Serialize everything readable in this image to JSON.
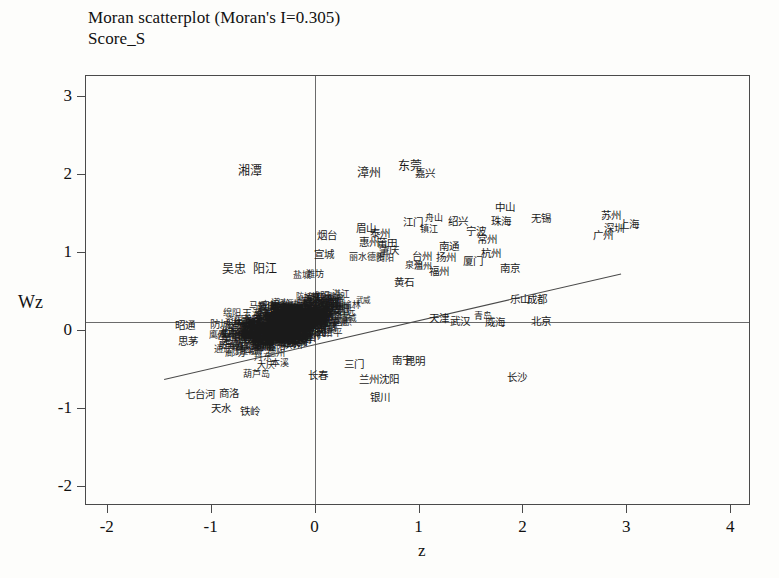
{
  "chart_data": {
    "type": "scatter",
    "title": "Moran scatterplot (Moran's I=0.305)",
    "subtitle": "Score_S",
    "xlabel": "z",
    "ylabel": "Wz",
    "morans_i": 0.305,
    "xlim": [
      -2.2,
      4.2
    ],
    "ylim": [
      -2.25,
      3.25
    ],
    "xticks": [
      "-2",
      "-1",
      "0",
      "1",
      "2",
      "3",
      "4"
    ],
    "xtick_values": [
      -2,
      -1,
      0,
      1,
      2,
      3,
      4
    ],
    "yticks": [
      "3",
      "2",
      "1",
      "0",
      "-1",
      "-2"
    ],
    "ytick_values": [
      3,
      2,
      1,
      0,
      -1,
      -2
    ],
    "grid": false,
    "legend": null,
    "reference_lines": {
      "horizontal_at_y": 0.1,
      "vertical_at_x": 0.0
    },
    "fit_line": {
      "x_start": -1.45,
      "y_start": -0.62,
      "x_end": 2.95,
      "y_end": 0.73,
      "slope": 0.305
    },
    "points": [
      {
        "label": "湘潭",
        "x": -0.62,
        "y": 2.03,
        "size": "l"
      },
      {
        "label": "漳州",
        "x": 0.52,
        "y": 2.01,
        "size": "l"
      },
      {
        "label": "东莞",
        "x": 0.92,
        "y": 2.1,
        "size": "l"
      },
      {
        "label": "嘉兴",
        "x": 1.06,
        "y": 2.01,
        "size": "m"
      },
      {
        "label": "中山",
        "x": 1.83,
        "y": 1.58,
        "size": "m"
      },
      {
        "label": "苏州",
        "x": 2.85,
        "y": 1.47,
        "size": "m"
      },
      {
        "label": "上海",
        "x": 3.03,
        "y": 1.36,
        "size": "m"
      },
      {
        "label": "深圳",
        "x": 2.88,
        "y": 1.31,
        "size": "m"
      },
      {
        "label": "广州",
        "x": 2.78,
        "y": 1.22,
        "size": "m"
      },
      {
        "label": "无锡",
        "x": 2.18,
        "y": 1.43,
        "size": "m"
      },
      {
        "label": "珠海",
        "x": 1.79,
        "y": 1.4,
        "size": "m"
      },
      {
        "label": "绍兴",
        "x": 1.38,
        "y": 1.39,
        "size": "m"
      },
      {
        "label": "江门",
        "x": 0.95,
        "y": 1.38,
        "size": "m"
      },
      {
        "label": "舟山",
        "x": 1.15,
        "y": 1.43,
        "size": "s"
      },
      {
        "label": "镇江",
        "x": 1.1,
        "y": 1.29,
        "size": "s"
      },
      {
        "label": "宁波",
        "x": 1.55,
        "y": 1.27,
        "size": "m"
      },
      {
        "label": "常州",
        "x": 1.66,
        "y": 1.17,
        "size": "m"
      },
      {
        "label": "眉山",
        "x": 0.49,
        "y": 1.3,
        "size": "m"
      },
      {
        "label": "泰州",
        "x": 0.63,
        "y": 1.24,
        "size": "m"
      },
      {
        "label": "烟台",
        "x": 0.12,
        "y": 1.22,
        "size": "m"
      },
      {
        "label": "惠州",
        "x": 0.52,
        "y": 1.13,
        "size": "m"
      },
      {
        "label": "莆田",
        "x": 0.7,
        "y": 1.12,
        "size": "m"
      },
      {
        "label": "肇庆",
        "x": 0.72,
        "y": 1.03,
        "size": "m"
      },
      {
        "label": "南通",
        "x": 1.29,
        "y": 1.07,
        "size": "m"
      },
      {
        "label": "杭州",
        "x": 1.7,
        "y": 0.99,
        "size": "m"
      },
      {
        "label": "宣城",
        "x": 0.09,
        "y": 0.97,
        "size": "m"
      },
      {
        "label": "丽水",
        "x": 0.42,
        "y": 0.93,
        "size": "s"
      },
      {
        "label": "德阳",
        "x": 0.59,
        "y": 0.94,
        "size": "s"
      },
      {
        "label": "贵阳",
        "x": 0.68,
        "y": 0.92,
        "size": "s"
      },
      {
        "label": "台州",
        "x": 1.03,
        "y": 0.95,
        "size": "m"
      },
      {
        "label": "扬州",
        "x": 1.26,
        "y": 0.94,
        "size": "m"
      },
      {
        "label": "厦门",
        "x": 1.52,
        "y": 0.88,
        "size": "m"
      },
      {
        "label": "泉州",
        "x": 0.96,
        "y": 0.83,
        "size": "s"
      },
      {
        "label": "温州",
        "x": 1.04,
        "y": 0.82,
        "size": "s"
      },
      {
        "label": "福州",
        "x": 1.2,
        "y": 0.76,
        "size": "m"
      },
      {
        "label": "南京",
        "x": 1.88,
        "y": 0.8,
        "size": "m"
      },
      {
        "label": "吴忠",
        "x": -0.78,
        "y": 0.78,
        "size": "l"
      },
      {
        "label": "阳江",
        "x": -0.48,
        "y": 0.78,
        "size": "l"
      },
      {
        "label": "盐城",
        "x": -0.12,
        "y": 0.7,
        "size": "s"
      },
      {
        "label": "潍坊",
        "x": 0.0,
        "y": 0.72,
        "size": "s"
      },
      {
        "label": "黄石",
        "x": 0.86,
        "y": 0.62,
        "size": "m"
      },
      {
        "label": "乐山",
        "x": 1.98,
        "y": 0.4,
        "size": "m"
      },
      {
        "label": "成都",
        "x": 2.14,
        "y": 0.4,
        "size": "m"
      },
      {
        "label": "天津",
        "x": 1.2,
        "y": 0.16,
        "size": "m"
      },
      {
        "label": "武汉",
        "x": 1.4,
        "y": 0.12,
        "size": "m"
      },
      {
        "label": "青岛",
        "x": 1.62,
        "y": 0.18,
        "size": "s"
      },
      {
        "label": "威海",
        "x": 1.74,
        "y": 0.1,
        "size": "m"
      },
      {
        "label": "北京",
        "x": 2.18,
        "y": 0.11,
        "size": "m"
      },
      {
        "label": "昭通",
        "x": -1.25,
        "y": 0.07,
        "size": "m"
      },
      {
        "label": "思茅",
        "x": -1.22,
        "y": -0.14,
        "size": "m"
      },
      {
        "label": "三门",
        "x": 0.38,
        "y": -0.43,
        "size": "m"
      },
      {
        "label": "南宁",
        "x": 0.84,
        "y": -0.38,
        "size": "m"
      },
      {
        "label": "昆明",
        "x": 0.97,
        "y": -0.4,
        "size": "m"
      },
      {
        "label": "兰州",
        "x": 0.52,
        "y": -0.62,
        "size": "m"
      },
      {
        "label": "沈阳",
        "x": 0.72,
        "y": -0.62,
        "size": "m"
      },
      {
        "label": "银川",
        "x": 0.63,
        "y": -0.86,
        "size": "m"
      },
      {
        "label": "长沙",
        "x": 1.95,
        "y": -0.6,
        "size": "m"
      },
      {
        "label": "长春",
        "x": 0.03,
        "y": -0.58,
        "size": "m"
      },
      {
        "label": "本溪",
        "x": -0.33,
        "y": -0.42,
        "size": "s"
      },
      {
        "label": "大庆",
        "x": -0.47,
        "y": -0.45,
        "size": "s"
      },
      {
        "label": "葫芦岛",
        "x": -0.56,
        "y": -0.56,
        "size": "s"
      },
      {
        "label": "七台河",
        "x": -1.1,
        "y": -0.82,
        "size": "m"
      },
      {
        "label": "商洛",
        "x": -0.82,
        "y": -0.8,
        "size": "m"
      },
      {
        "label": "天水",
        "x": -0.9,
        "y": -1.0,
        "size": "m"
      },
      {
        "label": "铁岭",
        "x": -0.62,
        "y": -1.03,
        "size": "m"
      }
    ],
    "dense_cluster_note": "A dense overplotted mass of ~300 overlapping Chinese city labels occupies the region approximately -1.3 < z < 1.0, -0.6 < Wz < 0.9"
  }
}
